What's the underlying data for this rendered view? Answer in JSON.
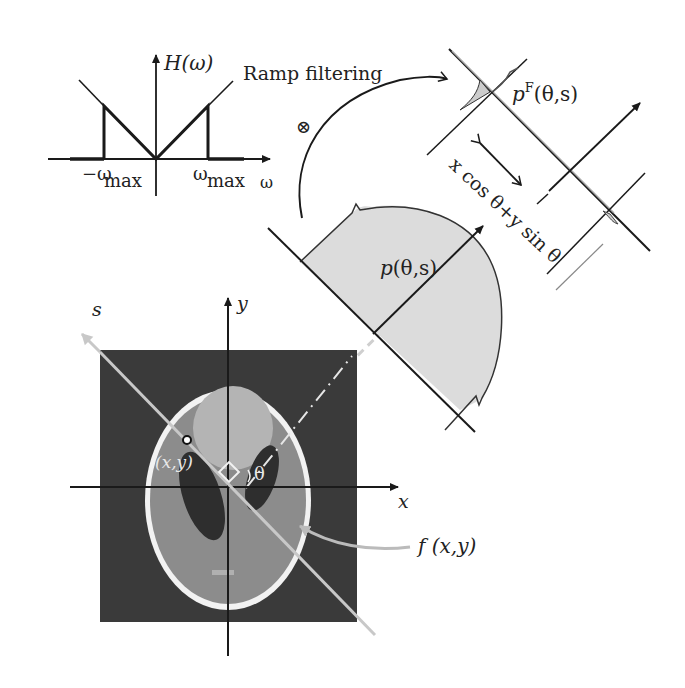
{
  "figure": {
    "type": "filtered-backprojection-diagram",
    "colors": {
      "background": "#ffffff",
      "ink": "#1a1a1a",
      "projection_fill": "#dcdcdc",
      "phantom_background": "#3a3a3a",
      "phantom_outer": "#8c8c8c",
      "phantom_skull": "#f2f2f2",
      "phantom_inner": "#b4b4b4",
      "phantom_dark": "#2e2e2e",
      "s_axis": "#c8c8c8",
      "dashed_ray": "#cfcfcf"
    }
  },
  "filter_plot": {
    "y_label": "H(ω)",
    "x_label": "ω",
    "neg_cutoff_label": "−ω",
    "neg_cutoff_sub": "max",
    "pos_cutoff_label": "ω",
    "pos_cutoff_sub": "max"
  },
  "ramp_arrow": {
    "label": "Ramp filtering",
    "convolution_symbol": "⊗"
  },
  "projection": {
    "label_p": "p",
    "label_args": "(θ,s)",
    "filtered_label_p": "p",
    "filtered_label_sup": "F",
    "filtered_label_args": "(θ,s)",
    "distance_label": "x cos θ+y sin θ"
  },
  "phantom": {
    "point_label": "(x,y)",
    "angle_label": "θ",
    "function_label": "f (x,y)",
    "axis_x": "x",
    "axis_y": "y",
    "axis_s": "s"
  }
}
